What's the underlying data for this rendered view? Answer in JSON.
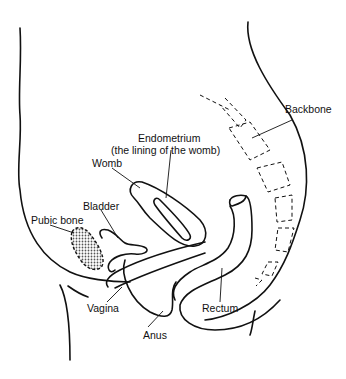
{
  "diagram": {
    "labels": {
      "backbone": "Backbone",
      "endometrium_line1": "Endometrium",
      "endometrium_line2": "(the lining of the womb)",
      "womb": "Womb",
      "bladder": "Bladder",
      "pubic_bone": "Pubic bone",
      "vagina": "Vagina",
      "anus": "Anus",
      "rectum": "Rectum"
    },
    "colors": {
      "stroke": "#111111",
      "background": "#ffffff",
      "pubic_fill": "#9a9a9a"
    }
  }
}
